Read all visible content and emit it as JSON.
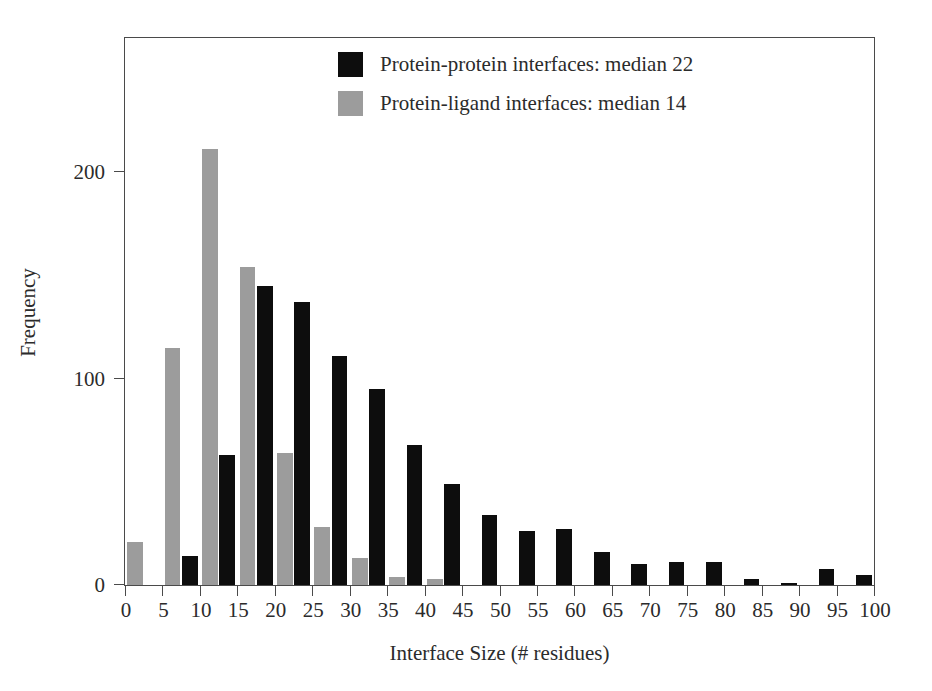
{
  "chart_data": {
    "type": "bar",
    "title": "",
    "subtitle": "",
    "xlabel": "Interface Size (# residues)",
    "ylabel": "Frequency",
    "xlim": [
      0,
      100
    ],
    "ylim": [
      0,
      265
    ],
    "grid": false,
    "legend_position": "top-center",
    "bin_width": 5,
    "bin_starts": [
      0,
      5,
      10,
      15,
      20,
      25,
      30,
      35,
      40,
      45,
      50,
      55,
      60,
      65,
      70,
      75,
      80,
      85,
      90,
      95
    ],
    "x_ticks": [
      0,
      5,
      10,
      15,
      20,
      25,
      30,
      35,
      40,
      45,
      50,
      55,
      60,
      65,
      70,
      75,
      80,
      85,
      90,
      95,
      100
    ],
    "x_tick_labels": [
      "0",
      "5",
      "10",
      "15",
      "20",
      "25",
      "30",
      "35",
      "40",
      "45",
      "50",
      "55",
      "60",
      "65",
      "70",
      "75",
      "80",
      "85",
      "90",
      "95",
      "100"
    ],
    "y_ticks": [
      0,
      100,
      200
    ],
    "y_tick_labels": [
      "0",
      "100",
      "200"
    ],
    "series": [
      {
        "name": "Protein-protein interfaces: median 22",
        "color": "#0d0d0d",
        "median": 22,
        "values": [
          0,
          14,
          63,
          145,
          137,
          111,
          95,
          68,
          49,
          34,
          26,
          27,
          16,
          10,
          11,
          11,
          3,
          1,
          8,
          5,
          4
        ]
      },
      {
        "name": "Protein-ligand interfaces: median 14",
        "color": "#9c9c9c",
        "median": 14,
        "values": [
          21,
          115,
          211,
          154,
          64,
          28,
          13,
          4,
          3,
          0,
          0,
          0,
          0,
          0,
          0,
          0,
          0,
          0,
          0,
          0,
          0
        ]
      }
    ]
  },
  "legend": {
    "items": [
      {
        "label": "Protein-protein interfaces: median 22",
        "color": "#0d0d0d"
      },
      {
        "label": "Protein-ligand interfaces: median 14",
        "color": "#9c9c9c"
      }
    ]
  },
  "colors": {
    "protein_protein": "#0d0d0d",
    "protein_ligand": "#9c9c9c",
    "axis": "#4a4a4a",
    "text": "#2b2b2b",
    "background": "#ffffff"
  }
}
